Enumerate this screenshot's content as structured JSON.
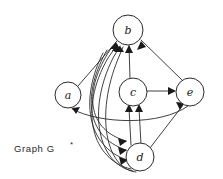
{
  "figure": {
    "caption": "Graph G",
    "caption_superscript": "*",
    "background_color": "#ffffff",
    "stroke_color": "#2b2b2b"
  },
  "graph": {
    "type": "directed",
    "nodes": [
      {
        "id": "b",
        "label": "b",
        "cx": 128,
        "cy": 30,
        "r": 15
      },
      {
        "id": "a",
        "label": "a",
        "cx": 68,
        "cy": 95,
        "r": 13
      },
      {
        "id": "c",
        "label": "c",
        "cx": 133,
        "cy": 92,
        "r": 14
      },
      {
        "id": "e",
        "label": "e",
        "cx": 190,
        "cy": 92,
        "r": 14
      },
      {
        "id": "d",
        "label": "d",
        "cx": 140,
        "cy": 157,
        "r": 14
      }
    ],
    "edges": [
      {
        "from": "a",
        "to": "b",
        "style": "straight"
      },
      {
        "from": "c",
        "to": "b",
        "style": "straight"
      },
      {
        "from": "e",
        "to": "b",
        "style": "straight"
      },
      {
        "from": "d",
        "to": "b",
        "style": "curved"
      },
      {
        "from": "d",
        "to": "b",
        "style": "curved"
      },
      {
        "from": "d",
        "to": "b",
        "style": "curved"
      },
      {
        "from": "c",
        "to": "e",
        "style": "straight"
      },
      {
        "from": "d",
        "to": "e",
        "style": "straight"
      },
      {
        "from": "d",
        "to": "c",
        "style": "straight"
      },
      {
        "from": "d",
        "to": "c",
        "style": "straight"
      },
      {
        "from": "e",
        "to": "a",
        "style": "curved"
      },
      {
        "from": "b",
        "to": "d",
        "style": "curved"
      },
      {
        "from": "a",
        "to": "d",
        "style": "curved"
      },
      {
        "from": "c",
        "to": "d",
        "style": "curved"
      }
    ]
  }
}
